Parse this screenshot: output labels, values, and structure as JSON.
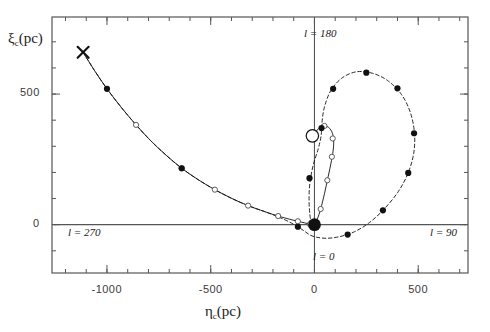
{
  "figure": {
    "width": 490,
    "height": 332,
    "background": "#ffffff",
    "foreground": "#555555",
    "marker_color": "#111111"
  },
  "axes": {
    "x_title": "η",
    "x_title_sub": "c",
    "x_title_unit": "(pc)",
    "y_title": "ξ",
    "y_title_sub": "c",
    "y_title_unit": "(pc)",
    "x_major_ticks": [
      -1000,
      -500,
      0,
      500
    ],
    "x_major_labels": [
      "-1000",
      "-500",
      "0",
      "500"
    ],
    "y_major_ticks": [
      0,
      500
    ],
    "y_major_labels": [
      "0",
      "500"
    ],
    "xlim": [
      -1265,
      740
    ],
    "ylim": [
      -185,
      795
    ],
    "x_minor_step": 100,
    "y_minor_step": 100,
    "grid": false
  },
  "annotations": {
    "l0": "l = 0",
    "l90": "l = 90",
    "l180": "l = 180",
    "l270": "l = 270"
  },
  "chart_data": {
    "type": "line",
    "title": "",
    "xlabel": "η_c (pc)",
    "ylabel": "ξ_c (pc)",
    "xlim": [
      -1265,
      740
    ],
    "ylim": [
      -185,
      795
    ],
    "grid": false,
    "series": [
      {
        "name": "solid-curve",
        "style": "solid",
        "marker": "open-circle",
        "path": [
          [
            -1115,
            660
          ],
          [
            -1060,
            590
          ],
          [
            -1000,
            520
          ],
          [
            -930,
            448
          ],
          [
            -860,
            382
          ],
          [
            -790,
            322
          ],
          [
            -715,
            266
          ],
          [
            -640,
            216
          ],
          [
            -560,
            172
          ],
          [
            -480,
            134
          ],
          [
            -400,
            101
          ],
          [
            -320,
            73
          ],
          [
            -240,
            50
          ],
          [
            -175,
            33
          ],
          [
            -120,
            21
          ],
          [
            -80,
            13
          ],
          [
            -48,
            7
          ],
          [
            -22,
            2
          ],
          [
            -8,
            0
          ],
          [
            0,
            3
          ],
          [
            14,
            22
          ],
          [
            30,
            60
          ],
          [
            48,
            118
          ],
          [
            66,
            184
          ],
          [
            82,
            245
          ],
          [
            92,
            298
          ],
          [
            90,
            340
          ],
          [
            74,
            368
          ],
          [
            48,
            378
          ],
          [
            20,
            368
          ],
          [
            0,
            345
          ],
          [
            -10,
            318
          ]
        ],
        "markers_open": [
          [
            -860,
            382
          ],
          [
            -640,
            216
          ],
          [
            -480,
            134
          ],
          [
            -320,
            73
          ],
          [
            -175,
            33
          ],
          [
            -80,
            13
          ],
          [
            -22,
            2
          ],
          [
            30,
            60
          ],
          [
            62,
            170
          ],
          [
            84,
            260
          ],
          [
            88,
            330
          ],
          [
            48,
            378
          ]
        ]
      },
      {
        "name": "dashed-curve",
        "style": "dashed",
        "marker": "filled-circle",
        "path": [
          [
            -1115,
            660
          ],
          [
            -1060,
            590
          ],
          [
            -1000,
            520
          ],
          [
            -930,
            448
          ],
          [
            -860,
            382
          ],
          [
            -790,
            322
          ],
          [
            -715,
            266
          ],
          [
            -640,
            216
          ],
          [
            -560,
            172
          ],
          [
            -480,
            134
          ],
          [
            -400,
            101
          ],
          [
            -320,
            73
          ],
          [
            -240,
            50
          ],
          [
            -175,
            30
          ],
          [
            -120,
            10
          ],
          [
            -80,
            -8
          ],
          [
            -48,
            -25
          ],
          [
            -20,
            -40
          ],
          [
            10,
            -48
          ],
          [
            60,
            -52
          ],
          [
            120,
            -46
          ],
          [
            190,
            -28
          ],
          [
            260,
            5
          ],
          [
            330,
            55
          ],
          [
            400,
            122
          ],
          [
            450,
            195
          ],
          [
            478,
            272
          ],
          [
            482,
            350
          ],
          [
            462,
            430
          ],
          [
            418,
            500
          ],
          [
            352,
            552
          ],
          [
            278,
            580
          ],
          [
            200,
            585
          ],
          [
            130,
            560
          ],
          [
            78,
            512
          ],
          [
            48,
            450
          ],
          [
            36,
            390
          ],
          [
            32,
            340
          ],
          [
            18,
            290
          ],
          [
            -6,
            228
          ],
          [
            -22,
            160
          ],
          [
            -26,
            90
          ],
          [
            -20,
            26
          ],
          [
            -8,
            0
          ]
        ],
        "markers_filled": [
          [
            -1000,
            520
          ],
          [
            -640,
            216
          ],
          [
            -80,
            -8
          ],
          [
            160,
            -38
          ],
          [
            330,
            55
          ],
          [
            452,
            198
          ],
          [
            480,
            350
          ],
          [
            400,
            522
          ],
          [
            250,
            582
          ],
          [
            90,
            520
          ],
          [
            34,
            370
          ],
          [
            -24,
            178
          ]
        ]
      }
    ],
    "special_markers": [
      {
        "name": "origin-dot",
        "x": 0,
        "y": 0,
        "style": "large-filled-circle"
      },
      {
        "name": "open-circle-marker",
        "x": -10,
        "y": 340,
        "style": "large-open-circle"
      },
      {
        "name": "cross-marker",
        "x": -1115,
        "y": 660,
        "style": "x-cross"
      }
    ],
    "reference_lines": [
      {
        "name": "horizontal-axis-line",
        "orientation": "horizontal",
        "value": 0
      },
      {
        "name": "vertical-axis-line",
        "orientation": "vertical",
        "value": 0
      }
    ]
  }
}
